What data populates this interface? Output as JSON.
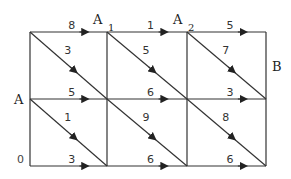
{
  "diagram": {
    "type": "weighted directed grid graph",
    "grid": {
      "xs": [
        30,
        107,
        187,
        266
      ],
      "ys": [
        32,
        99,
        166
      ]
    },
    "colors": {
      "line": "#333333",
      "text": "#222222",
      "background": "#ffffff"
    },
    "labels": {
      "A": {
        "text": "A",
        "x": 14,
        "y": 104
      },
      "A1": {
        "text": "A",
        "sub": "1",
        "x": 93,
        "y": 24,
        "subx": 108,
        "suby": 30
      },
      "A2": {
        "text": "A",
        "sub": "2",
        "x": 173,
        "y": 24,
        "subx": 188,
        "suby": 30
      },
      "B": {
        "text": "B",
        "x": 272,
        "y": 71
      },
      "origin": {
        "text": "0",
        "x": 17,
        "y": 162
      }
    },
    "horizontal_edges": [
      {
        "row": 0,
        "col": 0,
        "weight": "8"
      },
      {
        "row": 0,
        "col": 1,
        "weight": "1"
      },
      {
        "row": 0,
        "col": 2,
        "weight": "5"
      },
      {
        "row": 1,
        "col": 0,
        "weight": "5"
      },
      {
        "row": 1,
        "col": 1,
        "weight": "6"
      },
      {
        "row": 1,
        "col": 2,
        "weight": "3"
      },
      {
        "row": 2,
        "col": 0,
        "weight": "3"
      },
      {
        "row": 2,
        "col": 1,
        "weight": "6"
      },
      {
        "row": 2,
        "col": 2,
        "weight": "6"
      }
    ],
    "diagonal_edges": [
      {
        "row": 0,
        "col": 0,
        "weight": "3"
      },
      {
        "row": 0,
        "col": 1,
        "weight": "5"
      },
      {
        "row": 0,
        "col": 2,
        "weight": "7"
      },
      {
        "row": 1,
        "col": 0,
        "weight": "1"
      },
      {
        "row": 1,
        "col": 1,
        "weight": "9"
      },
      {
        "row": 1,
        "col": 2,
        "weight": "8"
      }
    ]
  }
}
